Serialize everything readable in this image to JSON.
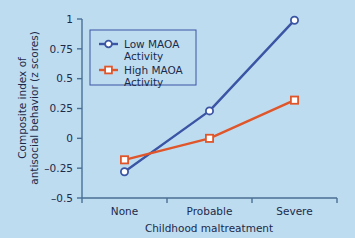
{
  "chart_data": {
    "type": "line",
    "title": "",
    "subtitle": "",
    "xlabel": "Childhood maltreatment",
    "ylabel": "Composite index of antisocial behavior (z scores)",
    "ylabel_line1": "Composite index of",
    "ylabel_line2": "antisocial behavior (z scores)",
    "categories": [
      "None",
      "Probable",
      "Severe"
    ],
    "yticks": [
      1,
      0.75,
      0.5,
      0.25,
      0,
      -0.25,
      -0.5
    ],
    "ytick_labels": [
      "1",
      "0.75",
      "0.5",
      "0.25",
      "0",
      "–0.25",
      "–0.5"
    ],
    "ylim": [
      -0.5,
      1
    ],
    "grid": false,
    "legend_position": "upper-left-inside",
    "series": [
      {
        "name": "Low MAOA Activity",
        "name_line1": "Low MAOA",
        "name_line2": "Activity",
        "color": "#3b55a5",
        "marker": "open-circle",
        "values": [
          -0.28,
          0.23,
          0.99
        ]
      },
      {
        "name": "High MAOA Activity",
        "name_line1": "High MAOA",
        "name_line2": "Activity",
        "color": "#e0562b",
        "marker": "open-square",
        "values": [
          -0.18,
          0.0,
          0.32
        ]
      }
    ]
  },
  "colors": {
    "background": "#bedcf0",
    "axis": "#4a6f95",
    "text": "#1b2a4a",
    "series_low": "#3b55a5",
    "series_high": "#e0562b",
    "marker_fill": "#ffffff"
  }
}
